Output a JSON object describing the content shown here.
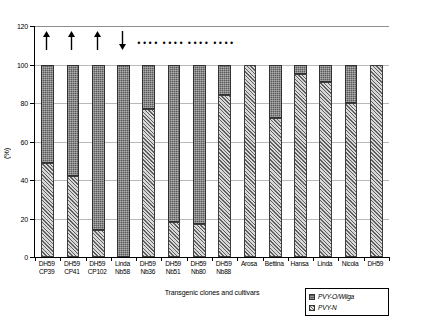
{
  "chart_data": {
    "type": "bar",
    "stacked": true,
    "title": "",
    "xlabel": "Transgenic clones and cultivars",
    "ylabel": "(%)",
    "ylim": [
      0,
      120
    ],
    "yticks": [
      0,
      20,
      40,
      60,
      80,
      100,
      120
    ],
    "grid": true,
    "legend_position": "bottom-right",
    "categories": [
      "DH59 CP39",
      "DH59 CP41",
      "DH59 CP102",
      "Linda Nb58",
      "DH59 Nb36",
      "DH59 Nb51",
      "DH59 Nb80",
      "DH59 Nb88",
      "Arosa",
      "Bettina",
      "Hansa",
      "Linda",
      "Nicola",
      "DH59"
    ],
    "category_lines": [
      [
        "DH59",
        "CP39"
      ],
      [
        "DH59",
        "CP41"
      ],
      [
        "DH59",
        "CP102"
      ],
      [
        "Linda",
        "Nb58"
      ],
      [
        "DH59",
        "Nb36"
      ],
      [
        "DH59",
        "Nb51"
      ],
      [
        "DH59",
        "Nb80"
      ],
      [
        "DH59",
        "Nb88"
      ],
      [
        "Arosa",
        ""
      ],
      [
        "Bettina",
        ""
      ],
      [
        "Hansa",
        ""
      ],
      [
        "Linda",
        ""
      ],
      [
        "Nicola",
        ""
      ],
      [
        "DH59",
        ""
      ]
    ],
    "series": [
      {
        "name": "PVY-N",
        "color": "#8c8c8c",
        "pattern": "diagonal-hatch",
        "values": [
          49,
          42,
          14,
          0,
          77,
          18,
          17,
          84,
          100,
          72,
          95,
          91,
          80,
          100
        ]
      },
      {
        "name": "PVY-O/Wilga",
        "color": "#5a5a5a",
        "pattern": "fine-dot",
        "values": [
          51,
          58,
          86,
          100,
          23,
          82,
          83,
          16,
          0,
          28,
          5,
          9,
          20,
          0
        ]
      }
    ],
    "totals": [
      100,
      100,
      100,
      100,
      100,
      100,
      100,
      100,
      100,
      100,
      100,
      100,
      100,
      100
    ],
    "annotations": [
      {
        "category_index": 0,
        "marker": "arrow-up"
      },
      {
        "category_index": 1,
        "marker": "arrow-up"
      },
      {
        "category_index": 2,
        "marker": "arrow-up"
      },
      {
        "category_index": 3,
        "marker": "arrow-down"
      },
      {
        "category_index": 4,
        "marker": "dots",
        "text": "••••"
      },
      {
        "category_index": 5,
        "marker": "dots",
        "text": "••••"
      },
      {
        "category_index": 6,
        "marker": "dots",
        "text": "••••"
      },
      {
        "category_index": 7,
        "marker": "dots",
        "text": "••••"
      }
    ]
  },
  "axis": {
    "y_title": "(%)",
    "x_title": "Transgenic clones and cultivars",
    "y_tick_labels": [
      "0",
      "20",
      "40",
      "60",
      "80",
      "100",
      "120"
    ]
  },
  "legend": {
    "items": [
      {
        "label": "PVY-O/Wilga"
      },
      {
        "label": "PVY-N"
      }
    ]
  }
}
